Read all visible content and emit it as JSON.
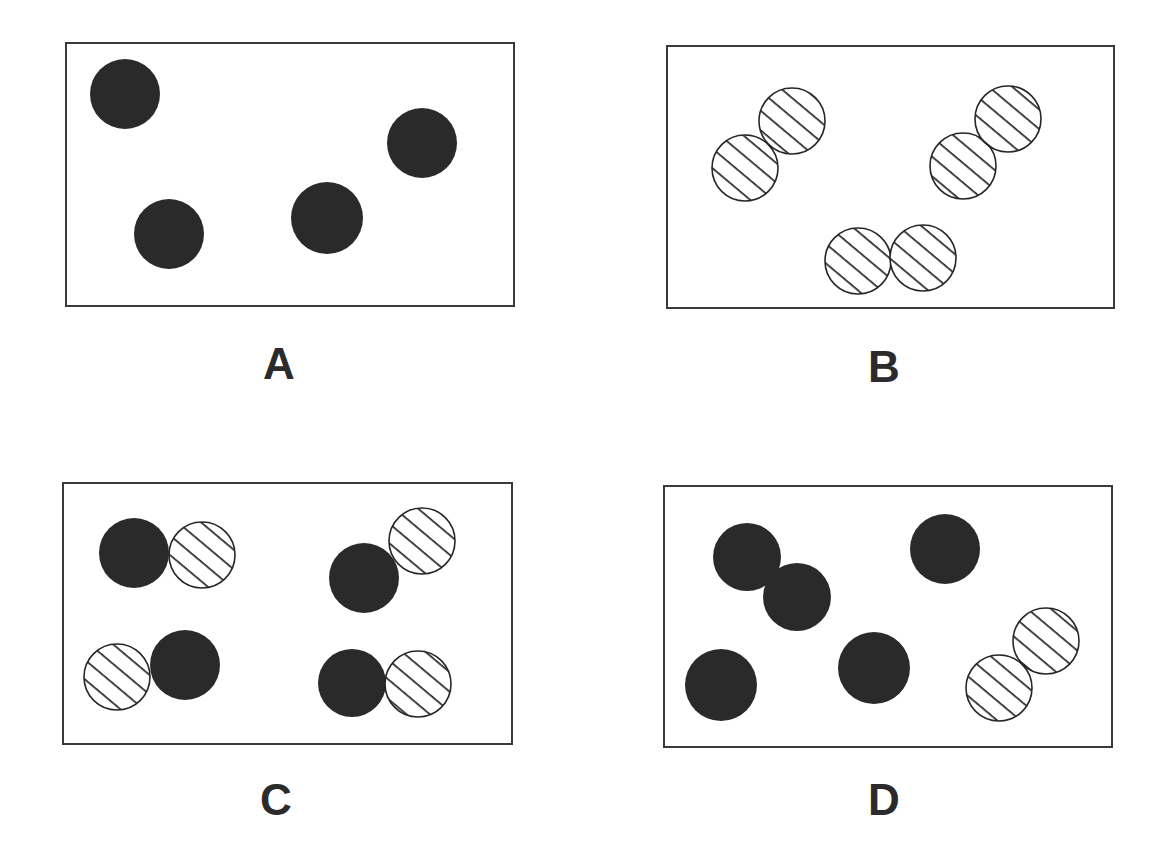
{
  "figure": {
    "width": 1169,
    "height": 844,
    "colors": {
      "background": "#ffffff",
      "box_border": "#3a3a3a",
      "solid_fill": "#2a2a2a",
      "hatch_stroke": "#262626",
      "hatch_fill": "#ffffff",
      "label": "#2b2b2b"
    },
    "legend_semantics": {
      "solid": "filled dark circle",
      "hatched": "white circle with diagonal stripes"
    },
    "panels": [
      {
        "id": "A",
        "label": "A",
        "box": {
          "x": 66,
          "y": 43,
          "w": 448,
          "h": 263
        },
        "label_pos": {
          "x": 279,
          "y": 364
        },
        "particles": [
          {
            "type": "solid",
            "cx": 125,
            "cy": 94,
            "r": 35
          },
          {
            "type": "solid",
            "cx": 169,
            "cy": 234,
            "r": 35
          },
          {
            "type": "solid",
            "cx": 327,
            "cy": 218,
            "r": 36
          },
          {
            "type": "solid",
            "cx": 422,
            "cy": 143,
            "r": 35
          }
        ]
      },
      {
        "id": "B",
        "label": "B",
        "box": {
          "x": 667,
          "y": 46,
          "w": 447,
          "h": 262
        },
        "label_pos": {
          "x": 884,
          "y": 367
        },
        "particles": [
          {
            "type": "hatched",
            "cx": 745,
            "cy": 168,
            "r": 33
          },
          {
            "type": "hatched",
            "cx": 792,
            "cy": 121,
            "r": 33
          },
          {
            "type": "hatched",
            "cx": 963,
            "cy": 166,
            "r": 33
          },
          {
            "type": "hatched",
            "cx": 1008,
            "cy": 119,
            "r": 33
          },
          {
            "type": "hatched",
            "cx": 858,
            "cy": 261,
            "r": 33
          },
          {
            "type": "hatched",
            "cx": 923,
            "cy": 258,
            "r": 33
          }
        ]
      },
      {
        "id": "C",
        "label": "C",
        "box": {
          "x": 63,
          "y": 483,
          "w": 449,
          "h": 261
        },
        "label_pos": {
          "x": 276,
          "y": 800
        },
        "particles": [
          {
            "type": "solid",
            "cx": 134,
            "cy": 553,
            "r": 35
          },
          {
            "type": "hatched",
            "cx": 202,
            "cy": 555,
            "r": 33
          },
          {
            "type": "solid",
            "cx": 364,
            "cy": 578,
            "r": 35
          },
          {
            "type": "hatched",
            "cx": 422,
            "cy": 541,
            "r": 33
          },
          {
            "type": "hatched",
            "cx": 117,
            "cy": 677,
            "r": 33
          },
          {
            "type": "solid",
            "cx": 185,
            "cy": 665,
            "r": 35
          },
          {
            "type": "solid",
            "cx": 352,
            "cy": 683,
            "r": 34
          },
          {
            "type": "hatched",
            "cx": 418,
            "cy": 684,
            "r": 33
          }
        ]
      },
      {
        "id": "D",
        "label": "D",
        "box": {
          "x": 664,
          "y": 486,
          "w": 448,
          "h": 261
        },
        "label_pos": {
          "x": 884,
          "y": 800
        },
        "particles": [
          {
            "type": "solid",
            "cx": 747,
            "cy": 557,
            "r": 34
          },
          {
            "type": "solid",
            "cx": 797,
            "cy": 597,
            "r": 34
          },
          {
            "type": "solid",
            "cx": 945,
            "cy": 549,
            "r": 35
          },
          {
            "type": "solid",
            "cx": 721,
            "cy": 685,
            "r": 36
          },
          {
            "type": "solid",
            "cx": 874,
            "cy": 668,
            "r": 36
          },
          {
            "type": "hatched",
            "cx": 999,
            "cy": 688,
            "r": 33
          },
          {
            "type": "hatched",
            "cx": 1046,
            "cy": 641,
            "r": 33
          }
        ]
      }
    ]
  }
}
